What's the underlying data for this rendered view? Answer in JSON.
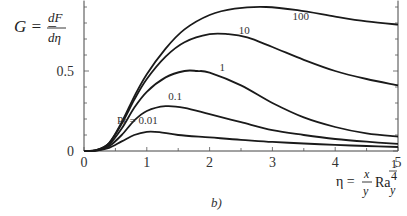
{
  "chart_data": {
    "type": "line",
    "title": "",
    "panel_label": "b)",
    "ylabel": {
      "lhs": "G = −",
      "num": "dF",
      "den": "dη"
    },
    "xlabel": {
      "lhs": "η =",
      "num": "x",
      "den": "y",
      "ra": "Ra",
      "sub": "y",
      "exp_num": "1",
      "exp_den": "4"
    },
    "xlim": [
      0,
      5
    ],
    "ylim": [
      0,
      0.94
    ],
    "x_ticks": [
      0,
      1,
      2,
      3,
      4,
      5
    ],
    "x_tick_labels": [
      "0",
      "1",
      "2",
      "3",
      "4",
      "5"
    ],
    "y_ticks_labeled": [
      0,
      0.5
    ],
    "y_tick_labels": [
      "0",
      "0.5"
    ],
    "y_minor_step": 0.1,
    "x_minor_step": 0.5,
    "grid": false,
    "legend": "inline curve labels",
    "series": [
      {
        "name": "Pr = 0.01",
        "label": "Pr = 0.01",
        "label_pos": [
          0.85,
          0.17
        ],
        "x": [
          0,
          0.2,
          0.4,
          0.6,
          0.8,
          1.0,
          1.2,
          1.5,
          2.0,
          2.5,
          3.0,
          3.5,
          4.0,
          4.5,
          5.0
        ],
        "values": [
          0,
          0.003,
          0.02,
          0.06,
          0.1,
          0.12,
          0.118,
          0.1,
          0.085,
          0.07,
          0.057,
          0.047,
          0.038,
          0.031,
          0.025
        ]
      },
      {
        "name": "Pr = 0.1",
        "label": "0.1",
        "label_pos": [
          1.45,
          0.32
        ],
        "x": [
          0,
          0.2,
          0.4,
          0.6,
          0.8,
          1.0,
          1.3,
          1.6,
          2.0,
          2.5,
          3.0,
          3.5,
          4.0,
          4.5,
          5.0
        ],
        "values": [
          0,
          0.004,
          0.03,
          0.1,
          0.19,
          0.25,
          0.28,
          0.27,
          0.23,
          0.18,
          0.13,
          0.1,
          0.075,
          0.058,
          0.045
        ]
      },
      {
        "name": "Pr = 1",
        "label": "1",
        "label_pos": [
          2.2,
          0.5
        ],
        "x": [
          0,
          0.2,
          0.4,
          0.6,
          0.8,
          1.0,
          1.3,
          1.6,
          1.8,
          2.0,
          2.5,
          3.0,
          3.5,
          4.0,
          4.5,
          5.0
        ],
        "values": [
          0,
          0.005,
          0.04,
          0.14,
          0.27,
          0.37,
          0.46,
          0.5,
          0.5,
          0.49,
          0.41,
          0.3,
          0.21,
          0.15,
          0.11,
          0.09
        ]
      },
      {
        "name": "Pr = 10",
        "label": "10",
        "label_pos": [
          2.55,
          0.73
        ],
        "x": [
          0,
          0.2,
          0.4,
          0.6,
          0.8,
          1.0,
          1.3,
          1.6,
          2.0,
          2.3,
          2.6,
          3.0,
          3.5,
          4.0,
          4.5,
          5.0
        ],
        "values": [
          0,
          0.006,
          0.05,
          0.17,
          0.32,
          0.45,
          0.59,
          0.68,
          0.73,
          0.73,
          0.71,
          0.65,
          0.57,
          0.5,
          0.45,
          0.41
        ]
      },
      {
        "name": "Pr = 100",
        "label": "100",
        "label_pos": [
          3.45,
          0.82
        ],
        "x": [
          0,
          0.2,
          0.4,
          0.6,
          0.8,
          1.0,
          1.3,
          1.6,
          2.0,
          2.4,
          2.9,
          3.4,
          4.0,
          4.5,
          5.0
        ],
        "values": [
          0,
          0.006,
          0.05,
          0.18,
          0.34,
          0.48,
          0.64,
          0.76,
          0.85,
          0.89,
          0.9,
          0.88,
          0.84,
          0.81,
          0.79
        ]
      }
    ]
  }
}
